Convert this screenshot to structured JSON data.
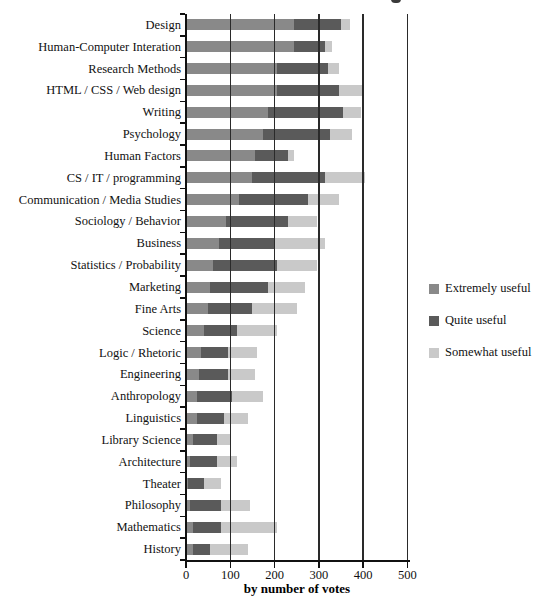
{
  "chart_data": {
    "type": "bar",
    "orientation": "horizontal",
    "stacked": true,
    "grid": "vertical",
    "legend_position": "right",
    "xlabel": "by number of votes",
    "xlim": [
      0,
      500
    ],
    "x_ticks": [
      "0",
      "100",
      "200",
      "300",
      "400",
      "500"
    ],
    "categories": [
      "Design",
      "Human-Computer Interation",
      "Research Methods",
      "HTML / CSS / Web design",
      "Writing",
      "Psychology",
      "Human Factors",
      "CS / IT / programming",
      "Communication / Media Studies",
      "Sociology / Behavior",
      "Business",
      "Statistics / Probability",
      "Marketing",
      "Fine Arts",
      "Science",
      "Logic / Rhetoric",
      "Engineering",
      "Anthropology",
      "Linguistics",
      "Library Science",
      "Architecture",
      "Theater",
      "Philosophy",
      "Mathematics",
      "History"
    ],
    "series": [
      {
        "name": "Extremely useful",
        "color": "#898989",
        "values": [
          245,
          245,
          205,
          205,
          185,
          175,
          155,
          150,
          120,
          90,
          75,
          60,
          55,
          50,
          40,
          35,
          30,
          25,
          25,
          15,
          10,
          5,
          10,
          15,
          15
        ]
      },
      {
        "name": "Quite useful",
        "color": "#5a5a5a",
        "values": [
          105,
          70,
          115,
          140,
          170,
          150,
          75,
          165,
          155,
          140,
          125,
          145,
          130,
          100,
          75,
          60,
          65,
          80,
          60,
          55,
          60,
          35,
          70,
          65,
          40
        ]
      },
      {
        "name": "Somewhat useful",
        "color": "#c9c9c9",
        "values": [
          20,
          15,
          25,
          55,
          40,
          50,
          15,
          90,
          70,
          65,
          115,
          90,
          85,
          100,
          90,
          65,
          60,
          70,
          55,
          30,
          45,
          40,
          65,
          125,
          85
        ]
      }
    ]
  },
  "colors": {
    "axis": "#111111",
    "gridline": "#2a2a2a",
    "background": "#ffffff"
  }
}
